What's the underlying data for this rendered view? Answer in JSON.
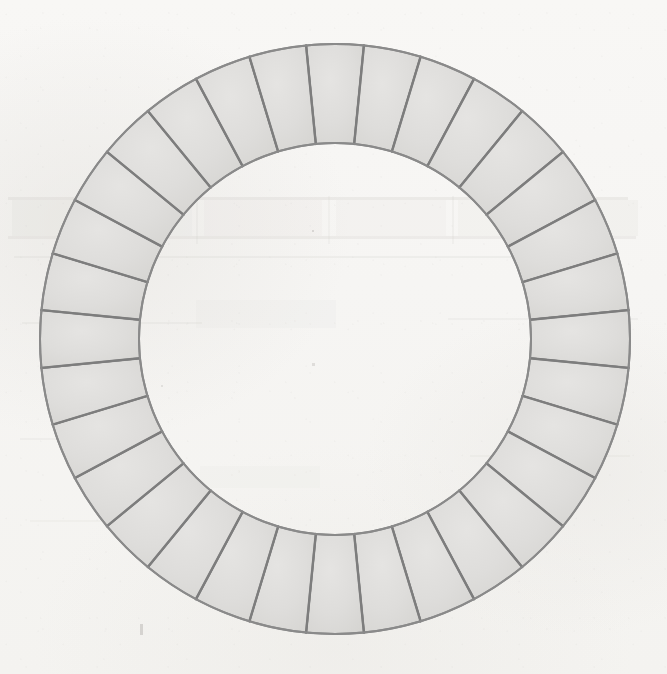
{
  "canvas": {
    "width": 667,
    "height": 674,
    "background_color": "#f7f6f4",
    "description": "Scanned black-and-white technical drawing of a segmented annular ring on off-white paper"
  },
  "colors": {
    "paper": "#f7f6f4",
    "segment_fill": "#dedddb",
    "segment_fill_light": "#e4e3e1",
    "stroke": "#8a8a8a",
    "stroke_dark": "#7d7d7d",
    "ghost_mark": "#d8d6d2"
  },
  "figure": {
    "name": "segmented-annulus",
    "shape_type": "annulus",
    "center_x": 335,
    "center_y": 339,
    "outer_radius": 295,
    "inner_radius": 196,
    "segment_count": 32,
    "segment_angle_deg": 11.25,
    "start_angle_deg": -5.625,
    "divider_at_top": true,
    "stroke_width": 2.0,
    "divider_stroke_width": 2.4,
    "fill": "#dedddb",
    "stroke": "#8a8a8a"
  },
  "chart_data": {
    "type": "pie",
    "title": "",
    "subtitle": "",
    "xlabel": "",
    "ylabel": "",
    "legend_position": "none",
    "grid": false,
    "variant": "donut",
    "inner_radius_ratio": 0.664,
    "categories": [
      "1",
      "2",
      "3",
      "4",
      "5",
      "6",
      "7",
      "8",
      "9",
      "10",
      "11",
      "12",
      "13",
      "14",
      "15",
      "16",
      "17",
      "18",
      "19",
      "20",
      "21",
      "22",
      "23",
      "24",
      "25",
      "26",
      "27",
      "28",
      "29",
      "30",
      "31",
      "32"
    ],
    "values": [
      1,
      1,
      1,
      1,
      1,
      1,
      1,
      1,
      1,
      1,
      1,
      1,
      1,
      1,
      1,
      1,
      1,
      1,
      1,
      1,
      1,
      1,
      1,
      1,
      1,
      1,
      1,
      1,
      1,
      1,
      1,
      1
    ],
    "slice_angle_deg": 11.25,
    "total_deg": 360,
    "annotations": []
  },
  "ghost_marks": {
    "note": "Faint residual impressions of an underlying printed table/text visible through the scan",
    "rows": [
      {
        "x": 8,
        "y": 197,
        "width": 620,
        "height": 3,
        "opacity": 0.3
      },
      {
        "x": 8,
        "y": 236,
        "width": 628,
        "height": 3,
        "opacity": 0.26
      },
      {
        "x": 14,
        "y": 256,
        "width": 600,
        "height": 2,
        "opacity": 0.2
      },
      {
        "x": 22,
        "y": 322,
        "width": 180,
        "height": 2,
        "opacity": 0.18
      },
      {
        "x": 448,
        "y": 318,
        "width": 190,
        "height": 2,
        "opacity": 0.16
      },
      {
        "x": 20,
        "y": 438,
        "width": 150,
        "height": 2,
        "opacity": 0.16
      },
      {
        "x": 470,
        "y": 455,
        "width": 160,
        "height": 2,
        "opacity": 0.14
      },
      {
        "x": 30,
        "y": 520,
        "width": 120,
        "height": 2,
        "opacity": 0.13
      }
    ],
    "blocks": [
      {
        "x": 12,
        "y": 200,
        "width": 74,
        "height": 36,
        "opacity": 0.17
      },
      {
        "x": 96,
        "y": 200,
        "width": 96,
        "height": 36,
        "opacity": 0.12
      },
      {
        "x": 204,
        "y": 200,
        "width": 118,
        "height": 36,
        "opacity": 0.11
      },
      {
        "x": 336,
        "y": 200,
        "width": 110,
        "height": 36,
        "opacity": 0.11
      },
      {
        "x": 458,
        "y": 200,
        "width": 92,
        "height": 36,
        "opacity": 0.13
      },
      {
        "x": 560,
        "y": 200,
        "width": 78,
        "height": 36,
        "opacity": 0.15
      },
      {
        "x": 196,
        "y": 300,
        "width": 140,
        "height": 28,
        "opacity": 0.09
      },
      {
        "x": 200,
        "y": 466,
        "width": 120,
        "height": 22,
        "opacity": 0.08
      }
    ],
    "verticals": [
      {
        "x": 90,
        "y": 196,
        "height": 48,
        "opacity": 0.2
      },
      {
        "x": 196,
        "y": 196,
        "height": 48,
        "opacity": 0.16
      },
      {
        "x": 328,
        "y": 196,
        "height": 48,
        "opacity": 0.15
      },
      {
        "x": 452,
        "y": 196,
        "height": 48,
        "opacity": 0.16
      },
      {
        "x": 554,
        "y": 196,
        "height": 48,
        "opacity": 0.18
      }
    ],
    "specks": [
      {
        "x": 140,
        "y": 624,
        "width": 3,
        "height": 11,
        "opacity": 0.4
      },
      {
        "x": 312,
        "y": 230,
        "width": 2,
        "height": 2,
        "opacity": 0.35
      },
      {
        "x": 312,
        "y": 363,
        "width": 3,
        "height": 3,
        "opacity": 0.3
      },
      {
        "x": 395,
        "y": 148,
        "width": 2,
        "height": 2,
        "opacity": 0.3
      },
      {
        "x": 161,
        "y": 385,
        "width": 2,
        "height": 2,
        "opacity": 0.25
      }
    ]
  }
}
